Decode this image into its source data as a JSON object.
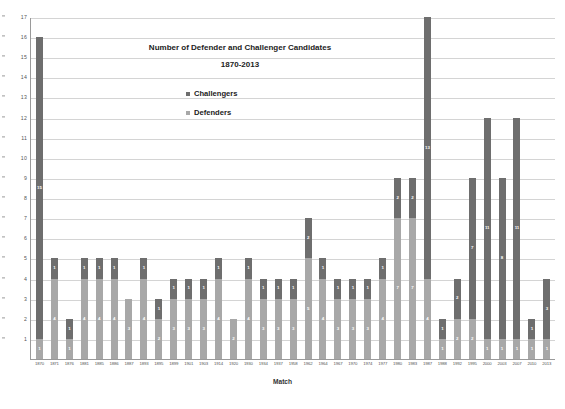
{
  "chart_data": {
    "type": "bar",
    "title": "Number of Defender and Challenger Candidates",
    "subtitle": "1870-2013",
    "xlabel": "Match",
    "ylabel": "",
    "ylim": [
      0,
      17
    ],
    "yticks": [
      1,
      2,
      3,
      4,
      5,
      6,
      7,
      8,
      9,
      10,
      11,
      12,
      13,
      14,
      15,
      16,
      17
    ],
    "grid": true,
    "stacked": true,
    "legend_position": "inside-top-center",
    "categories": [
      "1870",
      "1871",
      "1876",
      "1881",
      "1885",
      "1886",
      "1887",
      "1893",
      "1895",
      "1899",
      "1901",
      "1903",
      "1914",
      "1920",
      "1930",
      "1934",
      "1937",
      "1958",
      "1962",
      "1964",
      "1967",
      "1970",
      "1974",
      "1977",
      "1980",
      "1983",
      "1987",
      "1988",
      "1992",
      "1995",
      "2000",
      "2003",
      "2007",
      "2010",
      "2013"
    ],
    "series": [
      {
        "name": "Challengers",
        "color": "#6e6e6e",
        "values": [
          15,
          1,
          1,
          1,
          1,
          1,
          0,
          1,
          1,
          1,
          1,
          1,
          1,
          0,
          1,
          1,
          1,
          1,
          2,
          1,
          1,
          1,
          1,
          1,
          2,
          2,
          13,
          1,
          2,
          7,
          11,
          8,
          11,
          1,
          3
        ]
      },
      {
        "name": "Defenders",
        "color": "#a8a8a8",
        "values": [
          1,
          4,
          1,
          4,
          4,
          4,
          3,
          4,
          2,
          3,
          3,
          3,
          4,
          2,
          4,
          3,
          3,
          3,
          5,
          4,
          3,
          3,
          3,
          4,
          7,
          7,
          4,
          1,
          2,
          2,
          1,
          1,
          1,
          1,
          1
        ]
      }
    ],
    "totals": [
      16,
      5,
      2,
      5,
      5,
      5,
      3,
      5,
      3,
      4,
      4,
      4,
      5,
      2,
      5,
      4,
      4,
      4,
      7,
      5,
      4,
      4,
      4,
      5,
      9,
      9,
      17,
      2,
      4,
      9,
      12,
      9,
      12,
      2,
      4
    ]
  },
  "legend": {
    "challengers_label": "Challengers",
    "defenders_label": "Defenders"
  }
}
